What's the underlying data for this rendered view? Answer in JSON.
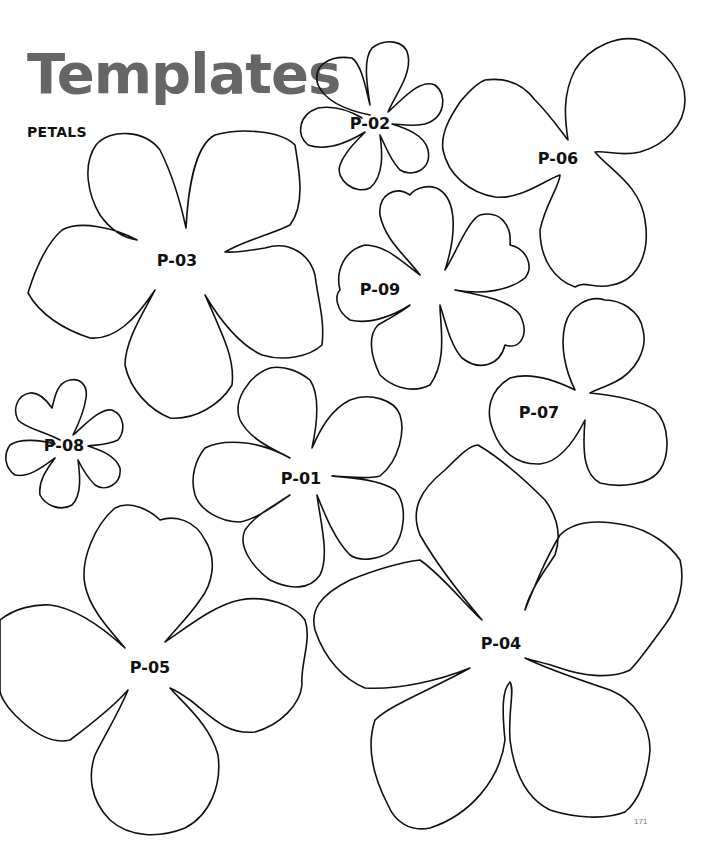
{
  "header": {
    "title": "Templates",
    "subtitle": "PETALS"
  },
  "templates": [
    {
      "id": "P-01",
      "label": "P-01"
    },
    {
      "id": "P-02",
      "label": "P-02"
    },
    {
      "id": "P-03",
      "label": "P-03"
    },
    {
      "id": "P-04",
      "label": "P-04"
    },
    {
      "id": "P-05",
      "label": "P-05"
    },
    {
      "id": "P-06",
      "label": "P-06"
    },
    {
      "id": "P-07",
      "label": "P-07"
    },
    {
      "id": "P-08",
      "label": "P-08"
    },
    {
      "id": "P-09",
      "label": "P-09"
    }
  ],
  "footer": {
    "page_number": "171"
  },
  "colors": {
    "title": "#666666",
    "outline": "#111111",
    "background": "#ffffff"
  }
}
